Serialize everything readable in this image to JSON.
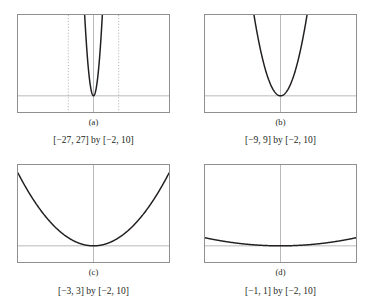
{
  "figure": {
    "title": "",
    "panels": [
      {
        "id": "a",
        "label": "(a)",
        "range_label": "[−27, 27] by [−2, 10]",
        "xmin": -27,
        "xmax": 27,
        "ymin": -2,
        "ymax": 10,
        "guides": [
          -9,
          9
        ],
        "guide_style": "dotted"
      },
      {
        "id": "b",
        "label": "(b)",
        "range_label": "[−9, 9] by [−2, 10]",
        "xmin": -9,
        "xmax": 9,
        "ymin": -2,
        "ymax": 10,
        "guides": [],
        "guide_style": "none"
      },
      {
        "id": "c",
        "label": "(c)",
        "range_label": "[−3, 3] by [−2, 10]",
        "xmin": -3,
        "xmax": 3,
        "ymin": -2,
        "ymax": 10,
        "guides": [],
        "guide_style": "none"
      },
      {
        "id": "d",
        "label": "(d)",
        "range_label": "[−1, 1] by [−2, 10]",
        "xmin": -1,
        "xmax": 1,
        "ymin": -2,
        "ymax": 10,
        "guides": [],
        "guide_style": "none"
      }
    ]
  },
  "chart_data": [
    {
      "type": "line",
      "title": "(a)",
      "subtitle": "[−27, 27] by [−2, 10]",
      "xlabel": "",
      "ylabel": "",
      "xlim": [
        -27,
        27
      ],
      "ylim": [
        -2,
        10
      ],
      "grid": false,
      "legend": "none",
      "function": "y = x^2",
      "annotations": [
        "dotted vertical guide at x = -9",
        "dotted vertical guide at x = 9"
      ],
      "x": [
        -3.2,
        -3.0,
        -2.8,
        -2.6,
        -2.4,
        -2.2,
        -2.0,
        -1.8,
        -1.6,
        -1.4,
        -1.2,
        -1.0,
        -0.8,
        -0.6,
        -0.4,
        -0.2,
        0.0,
        0.2,
        0.4,
        0.6,
        0.8,
        1.0,
        1.2,
        1.4,
        1.6,
        1.8,
        2.0,
        2.2,
        2.4,
        2.6,
        2.8,
        3.0,
        3.2
      ],
      "y": [
        10.24,
        9.0,
        7.84,
        6.76,
        5.76,
        4.84,
        4.0,
        3.24,
        2.56,
        1.96,
        1.44,
        1.0,
        0.64,
        0.36,
        0.16,
        0.04,
        0.0,
        0.04,
        0.16,
        0.36,
        0.64,
        1.0,
        1.44,
        1.96,
        2.56,
        3.24,
        4.0,
        4.84,
        5.76,
        6.76,
        7.84,
        9.0,
        10.24
      ]
    },
    {
      "type": "line",
      "title": "(b)",
      "subtitle": "[−9, 9] by [−2, 10]",
      "xlabel": "",
      "ylabel": "",
      "xlim": [
        -9,
        9
      ],
      "ylim": [
        -2,
        10
      ],
      "grid": false,
      "legend": "none",
      "function": "y = x^2",
      "annotations": [],
      "x": [
        -3.2,
        -3.0,
        -2.8,
        -2.6,
        -2.4,
        -2.2,
        -2.0,
        -1.8,
        -1.6,
        -1.4,
        -1.2,
        -1.0,
        -0.8,
        -0.6,
        -0.4,
        -0.2,
        0.0,
        0.2,
        0.4,
        0.6,
        0.8,
        1.0,
        1.2,
        1.4,
        1.6,
        1.8,
        2.0,
        2.2,
        2.4,
        2.6,
        2.8,
        3.0,
        3.2
      ],
      "y": [
        10.24,
        9.0,
        7.84,
        6.76,
        5.76,
        4.84,
        4.0,
        3.24,
        2.56,
        1.96,
        1.44,
        1.0,
        0.64,
        0.36,
        0.16,
        0.04,
        0.0,
        0.04,
        0.16,
        0.36,
        0.64,
        1.0,
        1.44,
        1.96,
        2.56,
        3.24,
        4.0,
        4.84,
        5.76,
        6.76,
        7.84,
        9.0,
        10.24
      ]
    },
    {
      "type": "line",
      "title": "(c)",
      "subtitle": "[−3, 3] by [−2, 10]",
      "xlabel": "",
      "ylabel": "",
      "xlim": [
        -3,
        3
      ],
      "ylim": [
        -2,
        10
      ],
      "grid": false,
      "legend": "none",
      "function": "y = x^2",
      "annotations": [],
      "x": [
        -3.0,
        -2.75,
        -2.5,
        -2.25,
        -2.0,
        -1.75,
        -1.5,
        -1.25,
        -1.0,
        -0.75,
        -0.5,
        -0.25,
        0.0,
        0.25,
        0.5,
        0.75,
        1.0,
        1.25,
        1.5,
        1.75,
        2.0,
        2.25,
        2.5,
        2.75,
        3.0
      ],
      "y": [
        9.0,
        7.5625,
        6.25,
        5.0625,
        4.0,
        3.0625,
        2.25,
        1.5625,
        1.0,
        0.5625,
        0.25,
        0.0625,
        0.0,
        0.0625,
        0.25,
        0.5625,
        1.0,
        1.5625,
        2.25,
        3.0625,
        4.0,
        5.0625,
        6.25,
        7.5625,
        9.0
      ]
    },
    {
      "type": "line",
      "title": "(d)",
      "subtitle": "[−1, 1] by [−2, 10]",
      "xlabel": "",
      "ylabel": "",
      "xlim": [
        -1,
        1
      ],
      "ylim": [
        -2,
        10
      ],
      "grid": false,
      "legend": "none",
      "function": "y = x^2",
      "annotations": [],
      "x": [
        -1.0,
        -0.9,
        -0.8,
        -0.7,
        -0.6,
        -0.5,
        -0.4,
        -0.3,
        -0.2,
        -0.1,
        0.0,
        0.1,
        0.2,
        0.3,
        0.4,
        0.5,
        0.6,
        0.7,
        0.8,
        0.9,
        1.0
      ],
      "y": [
        1.0,
        0.81,
        0.64,
        0.49,
        0.36,
        0.25,
        0.16,
        0.09,
        0.04,
        0.01,
        0.0,
        0.01,
        0.04,
        0.09,
        0.16,
        0.25,
        0.36,
        0.49,
        0.64,
        0.81,
        1.0
      ]
    }
  ],
  "colors": {
    "curve": "#231f20",
    "frame": "#8f8f8f",
    "axis": "#9a9a9a",
    "guide": "#b0b0b0",
    "text": "#231f20",
    "background": "#ffffff"
  }
}
